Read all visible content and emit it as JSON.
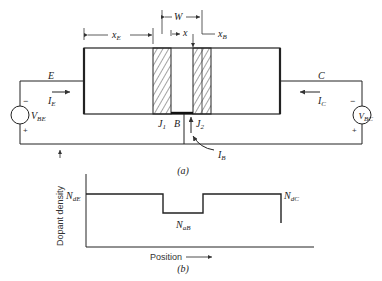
{
  "figure_a": {
    "caption": "(a)",
    "dimension_labels": {
      "xE": "x",
      "xE_sub": "E",
      "W": "W",
      "x": "x",
      "xB": "x",
      "xB_sub": "B"
    },
    "terminals": {
      "emitter": "E",
      "collector": "C",
      "base": "B"
    },
    "junctions": {
      "j1": "J",
      "j1_sub": "1",
      "j2": "J",
      "j2_sub": "2"
    },
    "currents": {
      "ie": "I",
      "ie_sub": "E",
      "ic": "I",
      "ic_sub": "C",
      "ib": "I",
      "ib_sub": "B"
    },
    "sources": {
      "vbe": {
        "label": "V",
        "sub": "BE",
        "minus": "−",
        "plus": "+"
      },
      "vbc": {
        "label": "V",
        "sub": "BC",
        "minus": "−",
        "plus": "+"
      }
    }
  },
  "figure_b": {
    "caption": "(b)",
    "ylabel": "Dopant density",
    "xlabel": "Position",
    "levels": {
      "nde": "N",
      "nde_sub": "dE",
      "nab": "N",
      "nab_sub": "aB",
      "ndc": "N",
      "ndc_sub": "dC"
    }
  }
}
